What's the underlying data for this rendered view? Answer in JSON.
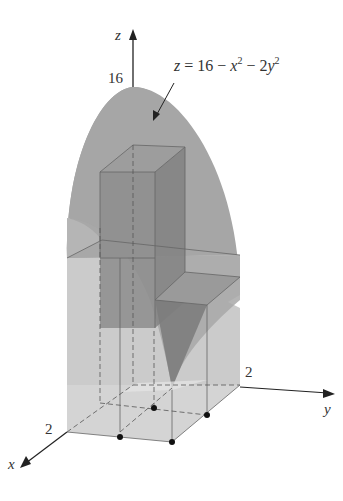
{
  "figure": {
    "axis_labels": {
      "z": "z",
      "y": "y",
      "x": "x"
    },
    "tick_labels": {
      "z_max": "16",
      "y_max": "2",
      "x_max": "2"
    },
    "surface_label": {
      "z": "z",
      "eq": " = 16 − ",
      "x": "x",
      "x_exp": "2",
      "mid": " − 2",
      "y": "y",
      "y_exp": "2"
    },
    "colors": {
      "surface": "#9a9a9a",
      "box_front": "#c8c8c8",
      "box_dark": "#8a8a8a",
      "axis": "#222222",
      "dot": "#111111"
    },
    "sample_points_count": 4
  }
}
